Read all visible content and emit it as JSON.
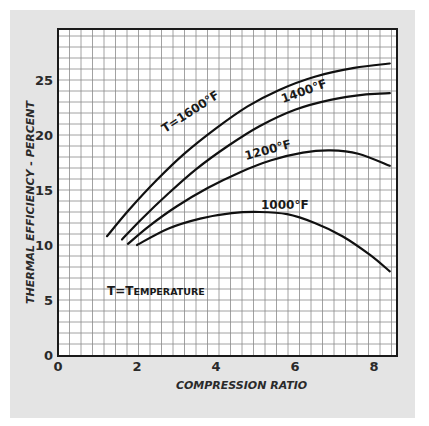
{
  "chart_data": {
    "type": "line",
    "title": "",
    "xlabel": "Compression Ratio",
    "ylabel": "Thermal Efficiency - Percent",
    "xlim": [
      0,
      8.8
    ],
    "ylim": [
      0,
      29
    ],
    "x_ticks": [
      "0",
      "2",
      "4",
      "6",
      "8"
    ],
    "y_ticks": [
      "0",
      "5",
      "10",
      "15",
      "20",
      "25"
    ],
    "grid": true,
    "legend_note": "T=Temperature",
    "series": [
      {
        "name": "T=1600°F",
        "label": "T=1600°F",
        "x": [
          1.24,
          1.8,
          2.5,
          3.2,
          4.0,
          4.8,
          5.6,
          6.5,
          7.5,
          8.4
        ],
        "y": [
          10.8,
          13.2,
          15.9,
          18.3,
          20.6,
          22.6,
          24.1,
          25.3,
          26.1,
          26.5
        ]
      },
      {
        "name": "1400°F",
        "label": "1400°F",
        "x": [
          1.62,
          2.1,
          2.8,
          3.5,
          4.3,
          5.1,
          6.0,
          6.9,
          7.8,
          8.4
        ],
        "y": [
          10.5,
          12.3,
          14.7,
          16.9,
          19.0,
          20.8,
          22.3,
          23.2,
          23.7,
          23.8
        ]
      },
      {
        "name": "1200°F",
        "label": "1200°F",
        "x": [
          1.77,
          2.3,
          3.0,
          3.8,
          4.6,
          5.4,
          6.2,
          6.9,
          7.6,
          8.4
        ],
        "y": [
          10.1,
          11.7,
          13.5,
          15.2,
          16.6,
          17.7,
          18.4,
          18.6,
          18.3,
          17.2
        ]
      },
      {
        "name": "1000°F",
        "label": "1000°F",
        "x": [
          2.0,
          2.8,
          3.6,
          4.4,
          5.1,
          5.8,
          6.5,
          7.2,
          7.9,
          8.4
        ],
        "y": [
          10.0,
          11.5,
          12.4,
          12.9,
          13.0,
          12.8,
          12.0,
          10.8,
          9.1,
          7.6
        ]
      }
    ]
  }
}
